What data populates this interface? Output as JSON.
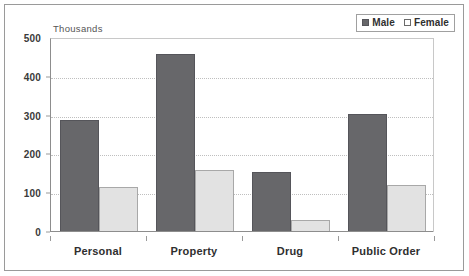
{
  "chart_data": {
    "type": "bar",
    "title": "",
    "subtitle": "",
    "unit_caption": "Thousands",
    "xlabel": "",
    "ylabel": "",
    "ylim": [
      0,
      500
    ],
    "ytick_values": [
      0,
      100,
      200,
      300,
      400,
      500
    ],
    "ytick_labels": [
      "0",
      "100",
      "200",
      "300",
      "400",
      "500"
    ],
    "grid": "horizontal-dotted",
    "legend_position": "top-right",
    "categories": [
      "Personal",
      "Property",
      "Drug",
      "Public Order"
    ],
    "series": [
      {
        "name": "Male",
        "color": "#67676a",
        "values": [
          288,
          458,
          155,
          305
        ]
      },
      {
        "name": "Female",
        "color": "#e2e2e2",
        "values": [
          117,
          160,
          32,
          120
        ]
      }
    ]
  },
  "legend": {
    "entries": [
      {
        "label": "Male",
        "swatch": "filled-square-icon"
      },
      {
        "label": "Female",
        "swatch": "empty-square-icon"
      }
    ]
  },
  "colors": {
    "male": "#67676a",
    "female": "#e2e2e2",
    "gridline": "#bfbfbf",
    "axis": "#8d8d8d",
    "frame": "#9a9a9a",
    "background": "#ffffff",
    "text": "#2f2f2f"
  }
}
